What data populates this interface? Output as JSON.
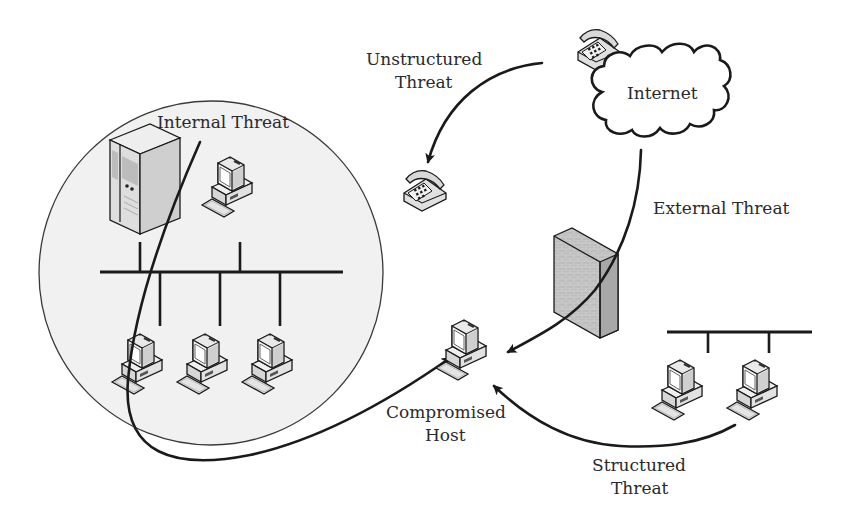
{
  "diagram": {
    "labels": {
      "internal_threat": "Internal Threat",
      "unstructured_line1": "Unstructured",
      "unstructured_line2": "Threat",
      "internet": "Internet",
      "external_threat": "External Threat",
      "compromised_line1": "Compromised",
      "compromised_line2": "Host",
      "structured_line1": "Structured",
      "structured_line2": "Threat"
    },
    "nodes": [
      {
        "id": "internal-network",
        "type": "zone-circle",
        "label": ""
      },
      {
        "id": "server",
        "type": "server"
      },
      {
        "id": "internal-pc-top",
        "type": "computer"
      },
      {
        "id": "internal-pc-1",
        "type": "computer"
      },
      {
        "id": "internal-pc-2",
        "type": "computer"
      },
      {
        "id": "internal-pc-3",
        "type": "computer"
      },
      {
        "id": "phone-source",
        "type": "telephone"
      },
      {
        "id": "phone-target",
        "type": "telephone"
      },
      {
        "id": "internet",
        "type": "cloud",
        "label": "Internet"
      },
      {
        "id": "firewall",
        "type": "firewall"
      },
      {
        "id": "compromised-host",
        "type": "computer",
        "label": "Compromised Host"
      },
      {
        "id": "external-pc-1",
        "type": "computer"
      },
      {
        "id": "external-pc-2",
        "type": "computer"
      }
    ],
    "edges": [
      {
        "from": "internal-network",
        "to": "compromised-host",
        "label": "Internal Threat",
        "directed": true
      },
      {
        "from": "phone-source",
        "to": "phone-target",
        "label": "Unstructured Threat",
        "directed": true
      },
      {
        "from": "internet",
        "to": "compromised-host",
        "label": "External Threat",
        "directed": true,
        "via": "firewall"
      },
      {
        "from": "external-pc-2",
        "to": "compromised-host",
        "label": "Structured Threat",
        "directed": true
      }
    ],
    "colors": {
      "line": "#1a1a1a",
      "zone_fill": "#f1f1f1",
      "device_fill": "#e6e6e6",
      "firewall_fill": "#b9b9b9",
      "text": "#2a2a2a"
    }
  }
}
